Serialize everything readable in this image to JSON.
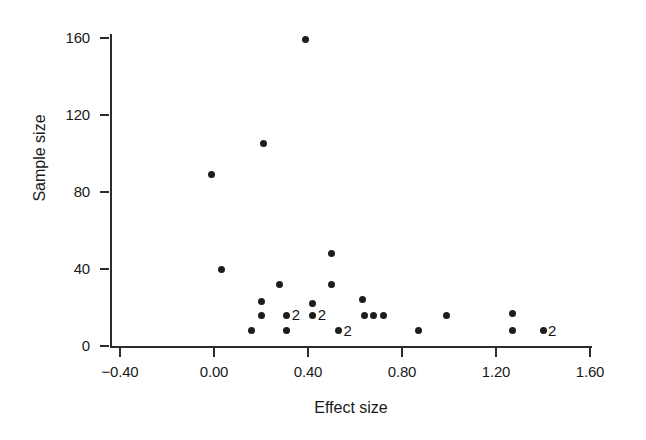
{
  "chart_data": {
    "type": "scatter",
    "title": "",
    "xlabel": "Effect size",
    "ylabel": "Sample size",
    "xlim": [
      -0.4,
      1.6
    ],
    "ylim": [
      0,
      160
    ],
    "xticks": [
      "-0.40",
      "0.00",
      "0.40",
      "0.80",
      "1.20",
      "1.60"
    ],
    "xtick_values": [
      -0.4,
      0.0,
      0.4,
      0.8,
      1.2,
      1.6
    ],
    "yticks": [
      "0",
      "40",
      "80",
      "120",
      "160"
    ],
    "ytick_values": [
      0,
      40,
      80,
      120,
      160
    ],
    "grid": false,
    "legend": null,
    "marker": "filled-circle",
    "overlap_label_note": "2",
    "points": [
      {
        "x": -0.01,
        "y": 89,
        "count": 1,
        "label": ""
      },
      {
        "x": 0.03,
        "y": 40,
        "count": 1,
        "label": ""
      },
      {
        "x": 0.16,
        "y": 8,
        "count": 1,
        "label": ""
      },
      {
        "x": 0.2,
        "y": 23,
        "count": 1,
        "label": ""
      },
      {
        "x": 0.2,
        "y": 16,
        "count": 1,
        "label": ""
      },
      {
        "x": 0.21,
        "y": 105,
        "count": 1,
        "label": ""
      },
      {
        "x": 0.28,
        "y": 32,
        "count": 1,
        "label": ""
      },
      {
        "x": 0.31,
        "y": 16,
        "count": 2,
        "label": "2"
      },
      {
        "x": 0.31,
        "y": 8,
        "count": 1,
        "label": ""
      },
      {
        "x": 0.39,
        "y": 159,
        "count": 1,
        "label": ""
      },
      {
        "x": 0.42,
        "y": 22,
        "count": 1,
        "label": ""
      },
      {
        "x": 0.42,
        "y": 16,
        "count": 2,
        "label": "2"
      },
      {
        "x": 0.5,
        "y": 48,
        "count": 1,
        "label": ""
      },
      {
        "x": 0.5,
        "y": 32,
        "count": 1,
        "label": ""
      },
      {
        "x": 0.53,
        "y": 8,
        "count": 2,
        "label": "2"
      },
      {
        "x": 0.63,
        "y": 24,
        "count": 1,
        "label": ""
      },
      {
        "x": 0.64,
        "y": 16,
        "count": 1,
        "label": ""
      },
      {
        "x": 0.68,
        "y": 16,
        "count": 1,
        "label": ""
      },
      {
        "x": 0.72,
        "y": 16,
        "count": 1,
        "label": ""
      },
      {
        "x": 0.87,
        "y": 8,
        "count": 1,
        "label": ""
      },
      {
        "x": 0.99,
        "y": 16,
        "count": 1,
        "label": ""
      },
      {
        "x": 1.27,
        "y": 17,
        "count": 1,
        "label": ""
      },
      {
        "x": 1.27,
        "y": 8,
        "count": 1,
        "label": ""
      },
      {
        "x": 1.4,
        "y": 8,
        "count": 2,
        "label": "2"
      }
    ]
  },
  "colors": {
    "marker": "#1d1d1d",
    "axis": "#2b2b2b",
    "text": "#1a1a1a",
    "background": "#ffffff"
  }
}
